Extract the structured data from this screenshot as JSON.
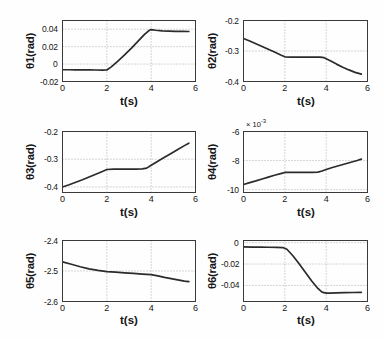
{
  "figure": {
    "width": 384,
    "height": 340,
    "background": "#fefefe",
    "line_color": "#2b2b2b",
    "axis_color": "#3a3a3a",
    "grid_color": "#9a9a9a"
  },
  "chart_data": [
    {
      "id": "theta1",
      "type": "line",
      "title": "",
      "ylabel": "θ1(rad)",
      "xlabel": "t(s)",
      "xlim": [
        0,
        6
      ],
      "ylim": [
        -0.02,
        0.05
      ],
      "xticks": [
        0,
        2,
        4,
        6
      ],
      "xticklabels": [
        "0",
        "2",
        "4",
        "6"
      ],
      "yticks": [
        -0.02,
        0,
        0.02,
        0.04
      ],
      "yticklabels": [
        "-0.02",
        "0",
        "0.02",
        "0.04"
      ],
      "grid": true,
      "exponent_label": "",
      "series": [
        {
          "name": "theta1",
          "x": [
            0,
            0.3,
            0.6,
            0.9,
            1.2,
            1.5,
            1.8,
            2.0,
            2.2,
            2.5,
            2.8,
            3.1,
            3.4,
            3.7,
            3.9,
            4.0,
            4.2,
            4.5,
            4.8,
            5.1,
            5.4,
            5.7
          ],
          "y": [
            -0.0065,
            -0.0065,
            -0.0066,
            -0.0066,
            -0.0067,
            -0.0068,
            -0.0069,
            -0.0068,
            -0.0032,
            0.0035,
            0.0105,
            0.018,
            0.026,
            0.034,
            0.0385,
            0.0395,
            0.0388,
            0.038,
            0.0378,
            0.0376,
            0.0375,
            0.0374
          ]
        }
      ]
    },
    {
      "id": "theta2",
      "type": "line",
      "title": "",
      "ylabel": "θ2(rad)",
      "xlabel": "t(s)",
      "xlim": [
        0,
        6
      ],
      "ylim": [
        -0.4,
        -0.2
      ],
      "xticks": [
        0,
        2,
        4,
        6
      ],
      "xticklabels": [
        "0",
        "2",
        "4",
        "6"
      ],
      "yticks": [
        -0.4,
        -0.3,
        -0.2
      ],
      "yticklabels": [
        "-0.4",
        "-0.3",
        "-0.2"
      ],
      "grid": true,
      "exponent_label": "",
      "series": [
        {
          "name": "theta2",
          "x": [
            0,
            0.3,
            0.6,
            0.9,
            1.2,
            1.5,
            1.8,
            2.0,
            2.3,
            2.6,
            3.0,
            3.4,
            3.7,
            3.9,
            4.2,
            4.5,
            4.8,
            5.1,
            5.4,
            5.7
          ],
          "y": [
            -0.259,
            -0.267,
            -0.276,
            -0.285,
            -0.294,
            -0.303,
            -0.313,
            -0.319,
            -0.32,
            -0.32,
            -0.32,
            -0.32,
            -0.32,
            -0.322,
            -0.332,
            -0.343,
            -0.353,
            -0.362,
            -0.37,
            -0.376
          ]
        }
      ]
    },
    {
      "id": "theta3",
      "type": "line",
      "title": "",
      "ylabel": "θ3(rad)",
      "xlabel": "t(s)",
      "xlim": [
        0,
        6
      ],
      "ylim": [
        -0.42,
        -0.2
      ],
      "xticks": [
        0,
        2,
        4,
        6
      ],
      "xticklabels": [
        "0",
        "2",
        "4",
        "6"
      ],
      "yticks": [
        -0.4,
        -0.3,
        -0.2
      ],
      "yticklabels": [
        "-0.4",
        "-0.3",
        "-0.2"
      ],
      "grid": true,
      "exponent_label": "",
      "series": [
        {
          "name": "theta3",
          "x": [
            0,
            0.3,
            0.6,
            0.9,
            1.2,
            1.5,
            1.8,
            2.0,
            2.3,
            2.6,
            3.0,
            3.3,
            3.6,
            3.8,
            4.0,
            4.3,
            4.6,
            4.9,
            5.2,
            5.5,
            5.7
          ],
          "y": [
            -0.4,
            -0.392,
            -0.383,
            -0.374,
            -0.364,
            -0.354,
            -0.344,
            -0.337,
            -0.336,
            -0.336,
            -0.336,
            -0.336,
            -0.335,
            -0.332,
            -0.322,
            -0.307,
            -0.293,
            -0.279,
            -0.265,
            -0.251,
            -0.242
          ]
        }
      ]
    },
    {
      "id": "theta4",
      "type": "line",
      "title": "",
      "ylabel": "θ4(rad)",
      "xlabel": "t(s)",
      "xlim": [
        0,
        6
      ],
      "ylim": [
        -10.2,
        -6
      ],
      "xticks": [
        0,
        2,
        4,
        6
      ],
      "xticklabels": [
        "0",
        "2",
        "4",
        "6"
      ],
      "yticks": [
        -10,
        -8,
        -6
      ],
      "yticklabels": [
        "-10",
        "-8",
        "-6"
      ],
      "grid": true,
      "exponent_label": "× 10",
      "exponent_power": "-3",
      "series": [
        {
          "name": "theta4",
          "x": [
            0,
            0.3,
            0.6,
            0.9,
            1.2,
            1.5,
            1.8,
            2.0,
            2.3,
            2.6,
            3.0,
            3.3,
            3.6,
            3.8,
            4.0,
            4.3,
            4.6,
            4.9,
            5.2,
            5.5,
            5.7
          ],
          "y": [
            -9.65,
            -9.52,
            -9.4,
            -9.27,
            -9.14,
            -9.01,
            -8.9,
            -8.82,
            -8.82,
            -8.82,
            -8.82,
            -8.82,
            -8.8,
            -8.72,
            -8.62,
            -8.48,
            -8.36,
            -8.24,
            -8.12,
            -8.0,
            -7.9
          ]
        }
      ]
    },
    {
      "id": "theta5",
      "type": "line",
      "title": "",
      "ylabel": "θ5(rad)",
      "xlabel": "t(s)",
      "xlim": [
        0,
        6
      ],
      "ylim": [
        -2.6,
        -2.4
      ],
      "xticks": [
        0,
        2,
        4,
        6
      ],
      "xticklabels": [
        "0",
        "2",
        "4",
        "6"
      ],
      "yticks": [
        -2.6,
        -2.5,
        -2.4
      ],
      "yticklabels": [
        "-2.6",
        "-2.5",
        "-2.4"
      ],
      "grid": true,
      "exponent_label": "",
      "series": [
        {
          "name": "theta5",
          "x": [
            0,
            0.4,
            0.8,
            1.2,
            1.6,
            2.0,
            2.4,
            2.8,
            3.2,
            3.6,
            4.0,
            4.3,
            4.6,
            4.9,
            5.2,
            5.5,
            5.7
          ],
          "y": [
            -2.47,
            -2.478,
            -2.486,
            -2.493,
            -2.498,
            -2.502,
            -2.504,
            -2.506,
            -2.508,
            -2.51,
            -2.512,
            -2.516,
            -2.521,
            -2.525,
            -2.529,
            -2.533,
            -2.535
          ]
        }
      ]
    },
    {
      "id": "theta6",
      "type": "line",
      "title": "",
      "ylabel": "θ6(rad)",
      "xlabel": "t(s)",
      "xlim": [
        0,
        6
      ],
      "ylim": [
        -0.055,
        0.002
      ],
      "xticks": [
        0,
        2,
        4,
        6
      ],
      "xticklabels": [
        "0",
        "2",
        "4",
        "6"
      ],
      "yticks": [
        -0.04,
        -0.02,
        0
      ],
      "yticklabels": [
        "-0.04",
        "-0.02",
        "0"
      ],
      "grid": true,
      "exponent_label": "",
      "series": [
        {
          "name": "theta6",
          "x": [
            0,
            0.4,
            0.8,
            1.2,
            1.6,
            1.9,
            2.1,
            2.4,
            2.7,
            3.0,
            3.3,
            3.6,
            3.8,
            4.0,
            4.2,
            4.5,
            4.9,
            5.3,
            5.7
          ],
          "y": [
            -0.004,
            -0.0041,
            -0.0042,
            -0.0043,
            -0.0044,
            -0.0046,
            -0.0062,
            -0.0125,
            -0.02,
            -0.028,
            -0.0358,
            -0.0428,
            -0.0462,
            -0.0472,
            -0.0472,
            -0.047,
            -0.0468,
            -0.0466,
            -0.0465
          ]
        }
      ]
    }
  ]
}
